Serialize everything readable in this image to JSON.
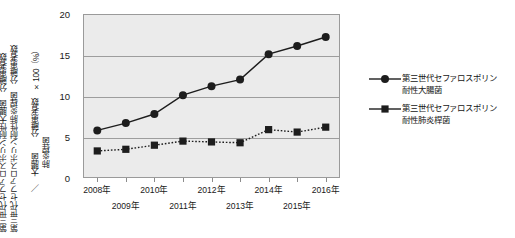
{
  "axis_titles": {
    "left_line_1": "第三世代セファロスポリン耐性大腸菌　分離患者数",
    "left_line_2": "第三世代セファロスポリン耐性肺炎桿菌　分離患者数",
    "left_line_3": "／　大腸菌　　分離患者数　×100（%）",
    "left_line_4": "　　　肺炎桿菌"
  },
  "legend": {
    "position": "right",
    "items": [
      {
        "label": "第三世代セファロスポリン\n耐性大腸菌",
        "marker": "circle",
        "line": "solid",
        "color": "#1d1d1d"
      },
      {
        "label": "第三世代セファロスポリン\n耐性肺炎桿菌",
        "marker": "square",
        "line": "solid",
        "color": "#1d1d1d"
      }
    ]
  },
  "colors": {
    "plot_background": "#ebebeb",
    "grid": "#9d9d9d",
    "frame": "#9a9a9a",
    "series_1": "#1d1d1d",
    "series_2": "#1d1d1d",
    "text": "#1a1a1a"
  },
  "chart_data": {
    "type": "line",
    "title": "",
    "xlabel": "",
    "ylabel": "第三世代セファロスポリン耐性大腸菌 分離患者数／第三世代セファロスポリン耐性肺炎桿菌 分離患者数 ÷ 大腸菌／肺炎桿菌 分離患者数 ×100（%）",
    "x": [
      "2008年",
      "2009年",
      "2010年",
      "2011年",
      "2012年",
      "2013年",
      "2014年",
      "2015年",
      "2016年"
    ],
    "xtick_labels": [
      "2008年",
      "2009年",
      "2010年",
      "2011年",
      "2012年",
      "2013年",
      "2014年",
      "2015年",
      "2016年"
    ],
    "xtick_rows": [
      0,
      1,
      0,
      1,
      0,
      1,
      0,
      1,
      0
    ],
    "ytick_labels": [
      "0",
      "5",
      "10",
      "15",
      "20"
    ],
    "yticks": [
      0,
      5,
      10,
      15,
      20
    ],
    "ylim": [
      0,
      20
    ],
    "grid": true,
    "grid_axis": "y",
    "legend_position": "right",
    "series": [
      {
        "name": "第三世代セファロスポリン耐性大腸菌",
        "marker": "circle",
        "linestyle": "solid",
        "values": [
          5.8,
          6.7,
          7.8,
          10.1,
          11.2,
          12.0,
          15.1,
          16.1,
          17.2
        ]
      },
      {
        "name": "第三世代セファロスポリン耐性肺炎桿菌",
        "marker": "square",
        "linestyle": "dotted",
        "values": [
          3.3,
          3.5,
          4.0,
          4.5,
          4.4,
          4.3,
          5.9,
          5.6,
          6.2
        ]
      }
    ]
  }
}
